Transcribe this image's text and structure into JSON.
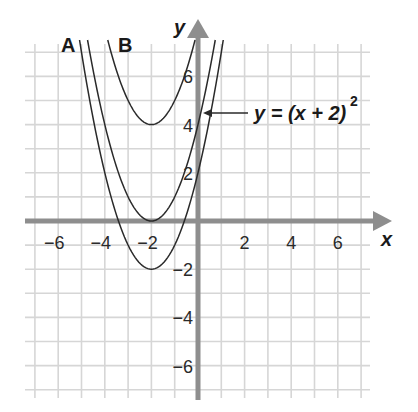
{
  "chart_data": {
    "type": "line",
    "title": "",
    "xlabel": "x",
    "ylabel": "y",
    "xlim": [
      -7,
      7
    ],
    "ylim": [
      -7,
      7
    ],
    "grid": true,
    "x_ticks": [
      -6,
      -4,
      -2,
      2,
      4,
      6
    ],
    "y_ticks": [
      6,
      4,
      2,
      -2,
      -4,
      -6
    ],
    "x_tick_labels": [
      "−6",
      "−4",
      "−2",
      "2",
      "4",
      "6"
    ],
    "y_tick_labels": [
      "6",
      "4",
      "2",
      "−2",
      "−4",
      "−6"
    ],
    "series": [
      {
        "name": "A",
        "equation": "y = (x + 2)^2 - 2",
        "vertex": [
          -2,
          -2
        ],
        "shift": -2
      },
      {
        "name": "y = (x + 2)^2",
        "equation": "y = (x + 2)^2",
        "vertex": [
          -2,
          0
        ],
        "shift": 0
      },
      {
        "name": "B",
        "equation": "y = (x + 2)^2 + 4",
        "vertex": [
          -2,
          4
        ],
        "shift": 4
      }
    ],
    "annotations": [
      {
        "text": "A",
        "target": "lower parabola"
      },
      {
        "text": "B",
        "target": "upper parabola"
      },
      {
        "text": "y = (x + 2)²",
        "target": "middle parabola",
        "arrow": true
      }
    ]
  },
  "labels": {
    "x_axis": "x",
    "y_axis": "y",
    "curve_a": "A",
    "curve_b": "B",
    "equation_main": "y = (x + 2)",
    "equation_exp": "2"
  },
  "colors": {
    "grid": "#d6d6d6",
    "axis": "#8e8e8e",
    "curve": "#2a2a2a",
    "text": "#1a1a1a"
  }
}
